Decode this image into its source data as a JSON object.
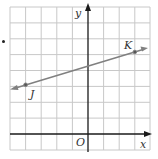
{
  "figure": {
    "type": "coordinate-grid-with-line",
    "axes": {
      "x_label": "x",
      "y_label": "y",
      "origin_label": "O"
    },
    "grid": {
      "x_range": [
        -5,
        4
      ],
      "y_range": [
        -1,
        8
      ],
      "spacing": 1
    },
    "line": {
      "color": "#808080",
      "through": [
        {
          "label": "J",
          "x": -4,
          "y": 3
        },
        {
          "label": "K",
          "x": 3,
          "y": 5
        }
      ],
      "arrows_both_ends": true
    },
    "points": [
      {
        "label": "J",
        "x": -4,
        "y": 3
      },
      {
        "label": "K",
        "x": 3,
        "y": 5
      }
    ],
    "colors": {
      "grid": "#c8c8c8",
      "axes": "#1a1a1a",
      "line": "#808080"
    }
  }
}
